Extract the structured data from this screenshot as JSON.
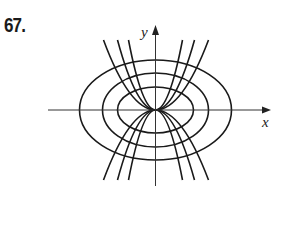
{
  "problem": {
    "number": "67."
  },
  "figure": {
    "type": "orthogonal-trajectories",
    "axes": {
      "x_label": "x",
      "y_label": "y"
    },
    "ellipses": [
      {
        "rx": 38,
        "ry": 23
      },
      {
        "rx": 53,
        "ry": 37
      },
      {
        "rx": 76,
        "ry": 50
      }
    ],
    "parabola_endpoints_dx": [
      -52,
      -38,
      -27,
      27,
      39,
      53
    ],
    "parabola_endpoint_dy": 70,
    "colors": {
      "curve": "#1a1a1a",
      "axis": "#333333"
    }
  }
}
